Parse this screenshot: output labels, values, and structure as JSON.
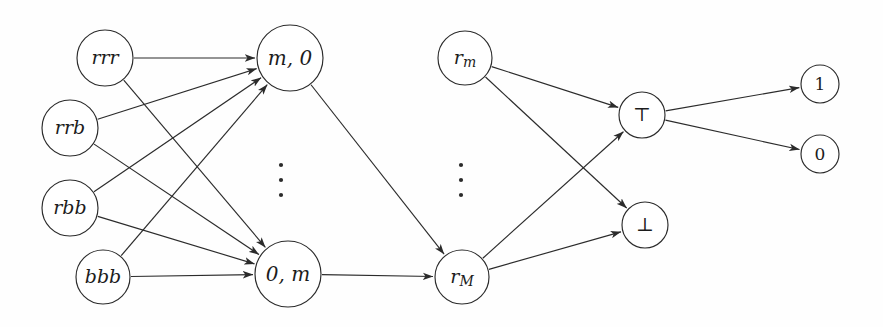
{
  "diagram": {
    "background_color": "#fefefe",
    "stroke_color": "#2b2b2b",
    "node_fill_color": "#ffffff",
    "nodes": [
      {
        "id": "rrr",
        "label": "rrr",
        "cx": 105,
        "cy": 58,
        "r": 28,
        "style": "italic",
        "font_size": 19
      },
      {
        "id": "rrb",
        "label": "rrb",
        "cx": 70,
        "cy": 128,
        "r": 28,
        "style": "italic",
        "font_size": 19
      },
      {
        "id": "rbb",
        "label": "rbb",
        "cx": 70,
        "cy": 208,
        "r": 28,
        "style": "italic",
        "font_size": 19
      },
      {
        "id": "bbb",
        "label": "bbb",
        "cx": 103,
        "cy": 277,
        "r": 27,
        "style": "italic",
        "font_size": 19
      },
      {
        "id": "m0",
        "label": "m, 0",
        "cx": 290,
        "cy": 58,
        "r": 33,
        "style": "italic",
        "font_size": 20
      },
      {
        "id": "0m",
        "label": "0, m",
        "cx": 288,
        "cy": 274,
        "r": 33,
        "style": "italic",
        "font_size": 20
      },
      {
        "id": "rm",
        "label": "r",
        "sub": "m",
        "cx": 465,
        "cy": 58,
        "r": 27,
        "style": "italic",
        "font_size": 19
      },
      {
        "id": "rM",
        "label": "r",
        "sub": "M",
        "cx": 462,
        "cy": 277,
        "r": 27,
        "style": "italic",
        "font_size": 19
      },
      {
        "id": "top",
        "label": "⊤",
        "cx": 642,
        "cy": 115,
        "r": 23,
        "style": "upright",
        "font_size": 19
      },
      {
        "id": "bot",
        "label": "⊥",
        "cx": 645,
        "cy": 225,
        "r": 23,
        "style": "upright",
        "font_size": 19
      },
      {
        "id": "one",
        "label": "1",
        "cx": 820,
        "cy": 84,
        "r": 19,
        "style": "upright",
        "font_size": 17
      },
      {
        "id": "zero",
        "label": "0",
        "cx": 820,
        "cy": 154,
        "r": 19,
        "style": "upright",
        "font_size": 17
      }
    ],
    "edges": [
      {
        "id": "e-rrr-m0",
        "from": "rrr",
        "to": "m0"
      },
      {
        "id": "e-rrr-0m",
        "from": "rrr",
        "to": "0m"
      },
      {
        "id": "e-rrb-m0",
        "from": "rrb",
        "to": "m0"
      },
      {
        "id": "e-rrb-0m",
        "from": "rrb",
        "to": "0m"
      },
      {
        "id": "e-rbb-m0",
        "from": "rbb",
        "to": "m0"
      },
      {
        "id": "e-rbb-0m",
        "from": "rbb",
        "to": "0m"
      },
      {
        "id": "e-bbb-m0",
        "from": "bbb",
        "to": "m0"
      },
      {
        "id": "e-bbb-0m",
        "from": "bbb",
        "to": "0m"
      },
      {
        "id": "e-m0-rM",
        "from": "m0",
        "to": "rM"
      },
      {
        "id": "e-0m-rM",
        "from": "0m",
        "to": "rM"
      },
      {
        "id": "e-rm-top",
        "from": "rm",
        "to": "top"
      },
      {
        "id": "e-rm-bot",
        "from": "rm",
        "to": "bot"
      },
      {
        "id": "e-rM-top",
        "from": "rM",
        "to": "top"
      },
      {
        "id": "e-rM-bot",
        "from": "rM",
        "to": "bot"
      },
      {
        "id": "e-top-one",
        "from": "top",
        "to": "one"
      },
      {
        "id": "e-top-zero",
        "from": "top",
        "to": "zero"
      }
    ],
    "ellipses": [
      {
        "id": "ellipsis-layer-2",
        "cx": 281,
        "cys": [
          165,
          180,
          195
        ],
        "r": 2.1
      },
      {
        "id": "ellipsis-layer-3",
        "cx": 461,
        "cys": [
          165,
          180,
          195
        ],
        "r": 2.1
      }
    ]
  }
}
